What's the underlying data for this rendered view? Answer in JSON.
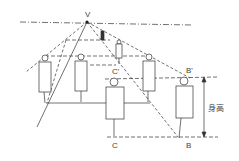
{
  "diagram": {
    "labels": {
      "vanishing_point": "V",
      "b_top": "B'",
      "b_bottom": "B",
      "c_top": "C'",
      "c_bottom": "C",
      "height": "身高"
    },
    "colors": {
      "line": "#333333",
      "background": "#ffffff"
    }
  }
}
